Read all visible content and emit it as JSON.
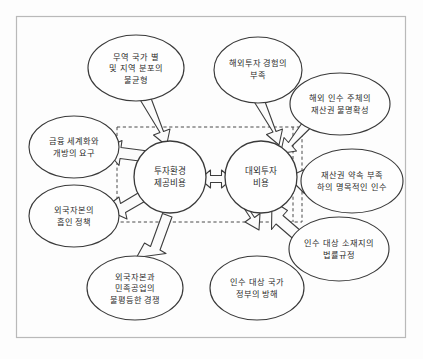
{
  "figure": {
    "frame": {
      "label": "diagram-frame"
    },
    "core_nodes": [
      {
        "id": "core-left",
        "lines": [
          "투자환경",
          "제공비용"
        ]
      },
      {
        "id": "core-right",
        "lines": [
          "대외투자",
          "비용"
        ]
      }
    ],
    "center_relation": {
      "icon": "double-headed-arrow-icon",
      "glyph": "⟺"
    },
    "left_factors": [
      {
        "id": "factor-trade-distribution",
        "lines": [
          "무역 국가 별",
          "및 지역 분포의",
          "불균형"
        ]
      },
      {
        "id": "factor-financial-globalization",
        "lines": [
          "금융 세계화와",
          "개방의 요구"
        ]
      },
      {
        "id": "factor-foreign-capital-attraction",
        "lines": [
          "외국자본의",
          "흡인 정책"
        ]
      },
      {
        "id": "factor-unequal-competition",
        "lines": [
          "외국자본과",
          "민족공업의",
          "불평등한 경쟁"
        ]
      }
    ],
    "right_factors": [
      {
        "id": "factor-lack-experience",
        "lines": [
          "해외투자 경험의",
          "부족"
        ]
      },
      {
        "id": "factor-property-rights-ambiguity",
        "lines": [
          "해외 인수 주체의",
          "재산권 불명확성"
        ]
      },
      {
        "id": "factor-nominal-acquisition",
        "lines": [
          "재산권 약속 부족",
          "하의 명목적인 인수"
        ]
      },
      {
        "id": "factor-legal-regulation",
        "lines": [
          "인수 대상 소재지의",
          "법률규정"
        ]
      },
      {
        "id": "factor-government-obstruction",
        "lines": [
          "인수 대상 국가",
          "정부의 방해"
        ]
      }
    ],
    "colors": {
      "frame_border": "#b9b9b9",
      "node_stroke": "#3a3a3a",
      "arrow_fill": "#fbfbfb",
      "dashed_stroke": "#4a4a4a",
      "text": "#2b2b2b",
      "background": "#fdfdfd"
    }
  }
}
